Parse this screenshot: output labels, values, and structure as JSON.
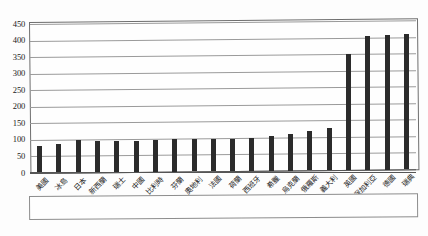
{
  "chart_data": {
    "type": "bar",
    "title": "",
    "xlabel": "",
    "ylabel": "",
    "ylim": [
      0,
      450
    ],
    "ytick_step": 50,
    "grid": true,
    "legend": "none",
    "bar_color": "#2b2b2b",
    "categories": [
      "美國",
      "冰島",
      "日本",
      "新西蘭",
      "瑞士",
      "中國",
      "比利時",
      "芬蘭",
      "奧地利",
      "法國",
      "荷蘭",
      "西班牙",
      "希臘",
      "烏克蘭",
      "俄羅斯",
      "義大利",
      "英國",
      "保加利亞",
      "德國",
      "瑞典"
    ],
    "values": [
      82,
      86,
      97,
      95,
      95,
      95,
      96,
      100,
      98,
      97,
      97,
      99,
      105,
      110,
      118,
      128,
      350,
      405,
      408,
      408
    ],
    "yticks": [
      "0",
      "50",
      "100",
      "150",
      "200",
      "250",
      "300",
      "350",
      "400",
      "450"
    ]
  }
}
